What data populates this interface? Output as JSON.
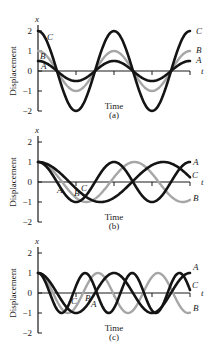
{
  "colors": {
    "black": "#141414",
    "gray": "#a6a6a6",
    "axis": "#1a1a1a"
  },
  "chart_data": [
    {
      "type": "line",
      "panel": "(a)",
      "xlabel": "Time",
      "ylabel": "Displacement",
      "x_axis_symbol": "t",
      "y_axis_symbol": "x",
      "yticks": [
        "2",
        "1",
        "0",
        "−1",
        "−2"
      ],
      "ylim": [
        -2,
        2
      ],
      "x_range_periods": 2,
      "series": [
        {
          "name": "A",
          "color": "black",
          "amplitude": 0.5,
          "period": 1,
          "phase": 0,
          "end_value": 0.5
        },
        {
          "name": "B",
          "color": "gray",
          "amplitude": 1.0,
          "period": 1,
          "phase": 0,
          "end_value": 1.0
        },
        {
          "name": "C",
          "color": "black",
          "amplitude": 2.0,
          "period": 1,
          "phase": 0,
          "end_value": 2.0
        }
      ]
    },
    {
      "type": "line",
      "panel": "(b)",
      "xlabel": "Time",
      "ylabel": "Displacement",
      "x_axis_symbol": "t",
      "y_axis_symbol": "x",
      "yticks": [
        "2",
        "1",
        "0",
        "−1",
        "−2"
      ],
      "ylim": [
        -2,
        2
      ],
      "x_range_periods": 2,
      "series": [
        {
          "name": "A",
          "color": "black",
          "amplitude": 1.0,
          "period": 1.0,
          "phase": 0
        },
        {
          "name": "B",
          "color": "gray",
          "amplitude": 1.0,
          "period": 1.27,
          "phase": 0
        },
        {
          "name": "C",
          "color": "black",
          "amplitude": 1.0,
          "period": 1.65,
          "phase": 0
        }
      ]
    },
    {
      "type": "line",
      "panel": "(c)",
      "xlabel": "Time",
      "ylabel": "Displacement",
      "x_axis_symbol": "t",
      "y_axis_symbol": "x",
      "yticks": [
        "2",
        "1",
        "0",
        "−1",
        "−2"
      ],
      "ylim": [
        -2,
        2
      ],
      "x_range_periods": 2,
      "series": [
        {
          "name": "A",
          "color": "black",
          "amplitude": 1.0,
          "period": 0.62,
          "phase": 0
        },
        {
          "name": "B",
          "color": "gray",
          "amplitude": 1.0,
          "period": 0.79,
          "phase": 0
        },
        {
          "name": "C",
          "color": "black",
          "amplitude": 1.0,
          "period": 1.0,
          "phase": 0
        }
      ]
    }
  ],
  "panels": [
    {
      "top": 0,
      "zero_y": 71,
      "caption": "(a)",
      "time_label": "Time",
      "y_label": "Displacement",
      "x_sym": "x",
      "t_sym": "t",
      "curve_labels": [
        {
          "text": "C",
          "x": 196,
          "y": 34
        },
        {
          "text": "B",
          "x": 196,
          "y": 53
        },
        {
          "text": "A",
          "x": 196,
          "y": 63
        },
        {
          "text": "C",
          "x": 47,
          "y": 40
        },
        {
          "text": "B",
          "x": 40,
          "y": 59
        },
        {
          "text": "A",
          "x": 41,
          "y": 69
        }
      ]
    },
    {
      "top": 111,
      "zero_y": 182,
      "caption": "(b)",
      "time_label": "Time",
      "y_label": "Displacement",
      "x_sym": "x",
      "t_sym": "t",
      "curve_labels": [
        {
          "text": "A",
          "x": 193,
          "y": 165
        },
        {
          "text": "C",
          "x": 192,
          "y": 178
        },
        {
          "text": "B",
          "x": 193,
          "y": 201
        },
        {
          "text": "A",
          "x": 57,
          "y": 193
        },
        {
          "text": "B",
          "x": 74,
          "y": 196
        },
        {
          "text": "C",
          "x": 81,
          "y": 191
        }
      ]
    },
    {
      "top": 222,
      "zero_y": 293,
      "caption": "(c)",
      "time_label": "Time",
      "y_label": "Displacement",
      "x_sym": "x",
      "t_sym": "t",
      "curve_labels": [
        {
          "text": "A",
          "x": 193,
          "y": 270
        },
        {
          "text": "C",
          "x": 192,
          "y": 288
        },
        {
          "text": "B",
          "x": 193,
          "y": 311
        },
        {
          "text": "C",
          "x": 71,
          "y": 304
        },
        {
          "text": "B",
          "x": 85,
          "y": 301
        },
        {
          "text": "A",
          "x": 91,
          "y": 307
        }
      ]
    }
  ]
}
